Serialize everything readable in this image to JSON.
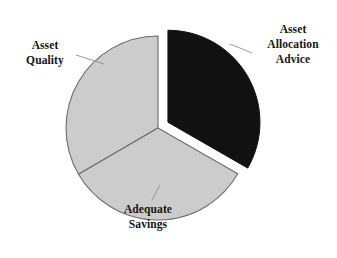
{
  "chart_data": {
    "type": "pie",
    "title": "",
    "subtitle": "",
    "xlabel": "",
    "ylabel": "",
    "legend_position": "none",
    "grid": false,
    "labels_position": "outside-with-leader-lines",
    "categories": [
      "Asset Allocation Advice",
      "Adequate Savings",
      "Asset Quality"
    ],
    "values": [
      33.3,
      33.3,
      33.4
    ],
    "slices": [
      {
        "label": "Asset Allocation Advice",
        "label_lines": [
          "Asset",
          "Allocation",
          "Advice"
        ],
        "value": 33.3,
        "color": "#111111",
        "exploded": true,
        "start_angle_deg": 0,
        "end_angle_deg": 120
      },
      {
        "label": "Adequate Savings",
        "label_lines": [
          "Adequate",
          "Savings"
        ],
        "value": 33.3,
        "color": "#cccccc",
        "exploded": false,
        "start_angle_deg": 120,
        "end_angle_deg": 240
      },
      {
        "label": "Asset Quality",
        "label_lines": [
          "Asset",
          "Quality"
        ],
        "value": 33.4,
        "color": "#cccccc",
        "exploded": false,
        "start_angle_deg": 240,
        "end_angle_deg": 360
      }
    ]
  },
  "colors": {
    "background": "#ffffff",
    "dark_slice": "#111111",
    "light_slice": "#cccccc",
    "slice_outline": "#6d6d6d",
    "leader_line": "#9a9a9a",
    "text": "#141414"
  },
  "labels": {
    "asset_allocation_advice": {
      "line1": "Asset",
      "line2": "Allocation",
      "line3": "Advice"
    },
    "asset_quality": {
      "line1": "Asset",
      "line2": "Quality"
    },
    "adequate_savings": {
      "line1": "Adequate",
      "line2": "Savings"
    }
  }
}
